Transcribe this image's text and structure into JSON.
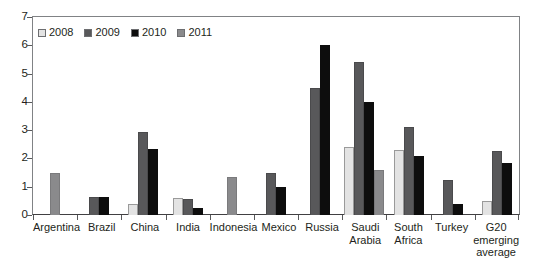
{
  "chart_data": {
    "type": "bar",
    "title": "",
    "subtitle": "",
    "xlabel": "",
    "ylabel": "",
    "ylim": [
      0,
      7
    ],
    "yticks": [
      0,
      1,
      2,
      3,
      4,
      5,
      6,
      7
    ],
    "ytick_labels": [
      "0",
      "1",
      "2",
      "3",
      "4",
      "5",
      "6",
      "7"
    ],
    "grid": false,
    "legend_position": "top-left",
    "categories": [
      "Argentina",
      "Brazil",
      "China",
      "India",
      "Indonesia",
      "Mexico",
      "Russia",
      "Saudi\nArabia",
      "South\nAfrica",
      "Turkey",
      "G20\nemerging\naverage"
    ],
    "series": [
      {
        "name": "2008",
        "color": "#e3e3e3",
        "values": [
          null,
          null,
          0.4,
          0.6,
          null,
          null,
          null,
          2.4,
          2.3,
          null,
          0.5
        ]
      },
      {
        "name": "2009",
        "color": "#58585a",
        "values": [
          null,
          0.65,
          2.95,
          0.55,
          null,
          1.5,
          4.5,
          5.4,
          3.1,
          1.25,
          2.25
        ]
      },
      {
        "name": "2010",
        "color": "#0d0d0d",
        "values": [
          null,
          0.65,
          2.35,
          0.25,
          null,
          1.0,
          6.0,
          4.0,
          2.1,
          0.4,
          1.85
        ]
      },
      {
        "name": "2011",
        "color": "#8a8a8c",
        "values": [
          1.5,
          null,
          null,
          null,
          1.35,
          null,
          null,
          1.6,
          null,
          null,
          null
        ]
      }
    ]
  },
  "legend": {
    "items": [
      {
        "label": "2008",
        "color": "#e3e3e3"
      },
      {
        "label": "2009",
        "color": "#58585a"
      },
      {
        "label": "2010",
        "color": "#0d0d0d"
      },
      {
        "label": "2011",
        "color": "#8a8a8c"
      }
    ]
  }
}
